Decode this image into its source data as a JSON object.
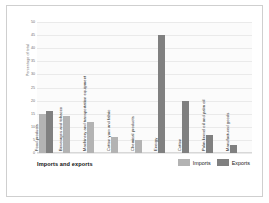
{
  "chart_data": {
    "type": "bar",
    "title": "",
    "xlabel": "Imports and exports",
    "ylabel": "Percentage of total",
    "ylim": [
      0,
      50
    ],
    "ytick_step": 5,
    "yticks": [
      "0",
      "5",
      "10",
      "15",
      "20",
      "25",
      "30",
      "35",
      "40",
      "45",
      "50"
    ],
    "grid": true,
    "legend_position": "bottom-right",
    "categories": [
      "Food products",
      "Beverages and tobacco",
      "Machinery and transportation equipment",
      "Cotton yarn and fabric",
      "Chemical products",
      "Energy",
      "Cotton",
      "Palm kernel oil and palm oil",
      "Manufactured goods"
    ],
    "series": [
      {
        "name": "Imports",
        "color": "#b3b3b3",
        "values": [
          15,
          14,
          12,
          6,
          5,
          null,
          null,
          null,
          null
        ]
      },
      {
        "name": "Exports",
        "color": "#808080",
        "values": [
          16,
          null,
          null,
          null,
          null,
          45,
          20,
          7,
          3
        ]
      }
    ],
    "bars": [
      {
        "category": "Food products",
        "series": "Imports",
        "value": 15
      },
      {
        "category": "Food products",
        "series": "Exports",
        "value": 16
      },
      {
        "category": "Beverages and tobacco",
        "series": "Imports",
        "value": 14
      },
      {
        "category": "Machinery and transportation equipment",
        "series": "Imports",
        "value": 12
      },
      {
        "category": "Cotton yarn and fabric",
        "series": "Imports",
        "value": 6
      },
      {
        "category": "Chemical products",
        "series": "Imports",
        "value": 5
      },
      {
        "category": "Energy",
        "series": "Exports",
        "value": 45
      },
      {
        "category": "Cotton",
        "series": "Exports",
        "value": 20
      },
      {
        "category": "Palm kernel oil and palm oil",
        "series": "Exports",
        "value": 7
      },
      {
        "category": "Manufactured goods",
        "series": "Exports",
        "value": 3
      }
    ]
  },
  "legend": {
    "imports_label": "Imports",
    "exports_label": "Exports"
  },
  "colors": {
    "imports": "#b3b3b3",
    "exports": "#808080",
    "grid": "#eaeaea",
    "frame": "#cfcfcf",
    "text": "#1a1a1a",
    "axis_text": "#6b6b6b"
  }
}
